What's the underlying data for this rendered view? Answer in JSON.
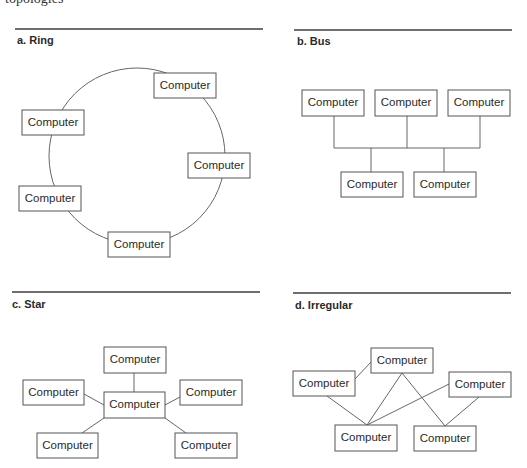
{
  "caption_fragment": "topologies",
  "colors": {
    "rule": "#6e6e6e",
    "stroke": "#555555",
    "text": "#2a2a2a",
    "background": "#ffffff"
  },
  "panels": [
    {
      "id": "ring",
      "label": "a. Ring",
      "node_label": "Computer",
      "nodes": [
        {
          "label": "Computer",
          "x": 154,
          "y": 73
        },
        {
          "label": "Computer",
          "x": 22,
          "y": 110
        },
        {
          "label": "Computer",
          "x": 188,
          "y": 153
        },
        {
          "label": "Computer",
          "x": 19,
          "y": 186
        },
        {
          "label": "Computer",
          "x": 108,
          "y": 232
        }
      ],
      "ring": {
        "cx": 137,
        "cy": 156,
        "r": 88
      }
    },
    {
      "id": "bus",
      "label": "b. Bus",
      "nodes": [
        {
          "label": "Computer",
          "x": 302,
          "y": 90
        },
        {
          "label": "Computer",
          "x": 375,
          "y": 90
        },
        {
          "label": "Computer",
          "x": 448,
          "y": 90
        },
        {
          "label": "Computer",
          "x": 341,
          "y": 172
        },
        {
          "label": "Computer",
          "x": 414,
          "y": 172
        }
      ]
    },
    {
      "id": "star",
      "label": "c. Star",
      "nodes": [
        {
          "label": "Computer",
          "x": 104,
          "y": 347
        },
        {
          "label": "Computer",
          "x": 23,
          "y": 380
        },
        {
          "label": "Computer",
          "x": 104,
          "y": 392
        },
        {
          "label": "Computer",
          "x": 180,
          "y": 380
        },
        {
          "label": "Computer",
          "x": 37,
          "y": 433
        },
        {
          "label": "Computer",
          "x": 175,
          "y": 433
        }
      ]
    },
    {
      "id": "irregular",
      "label": "d. Irregular",
      "nodes": [
        {
          "label": "Computer",
          "x": 371,
          "y": 348
        },
        {
          "label": "Computer",
          "x": 293,
          "y": 371
        },
        {
          "label": "Computer",
          "x": 449,
          "y": 372
        },
        {
          "label": "Computer",
          "x": 335,
          "y": 425
        },
        {
          "label": "Computer",
          "x": 414,
          "y": 426
        }
      ]
    }
  ]
}
